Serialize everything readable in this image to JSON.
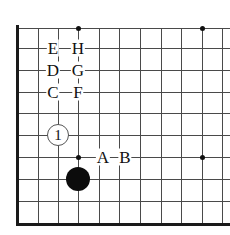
{
  "figure": {
    "name": "go-board-corner-diagram",
    "width": 230,
    "height": 235,
    "background_color": "#ffffff",
    "line_color": "#4a4a4a",
    "edge_color": "#1a1a1a",
    "stone_black_color": "#0c0c0c",
    "stone_white_color": "#ffffff"
  },
  "grid": {
    "x_positions": [
      17,
      38,
      58,
      78,
      99,
      119,
      140,
      161,
      181,
      202,
      222
    ],
    "y_positions": [
      28,
      48,
      70,
      92,
      113,
      135,
      157,
      179,
      201,
      223
    ],
    "edges": {
      "left_x": 17,
      "bottom_y": 223,
      "top_y": 28,
      "right_x": 230
    }
  },
  "star_points": [
    {
      "name": "star-point-top-left",
      "x": 78,
      "y": 28
    },
    {
      "name": "star-point-top-right",
      "x": 202,
      "y": 28
    },
    {
      "name": "star-point-center-right",
      "x": 202,
      "y": 157
    },
    {
      "name": "star-point-lower-left",
      "x": 78,
      "y": 157
    }
  ],
  "stones": [
    {
      "name": "white-stone-move-1",
      "color": "white",
      "label": "1",
      "x": 58,
      "y": 135,
      "radius": 11
    },
    {
      "name": "black-stone",
      "color": "black",
      "label": "",
      "x": 78,
      "y": 179,
      "radius": 12
    }
  ],
  "labels": [
    {
      "name": "board-label-e",
      "text": "E",
      "x": 53,
      "y": 48
    },
    {
      "name": "board-label-h",
      "text": "H",
      "x": 78,
      "y": 48
    },
    {
      "name": "board-label-d",
      "text": "D",
      "x": 53,
      "y": 70
    },
    {
      "name": "board-label-g",
      "text": "G",
      "x": 78,
      "y": 70
    },
    {
      "name": "board-label-c",
      "text": "C",
      "x": 53,
      "y": 92
    },
    {
      "name": "board-label-f",
      "text": "F",
      "x": 78,
      "y": 92
    },
    {
      "name": "board-label-a",
      "text": "A",
      "x": 103,
      "y": 157
    },
    {
      "name": "board-label-b",
      "text": "B",
      "x": 125,
      "y": 157
    }
  ]
}
